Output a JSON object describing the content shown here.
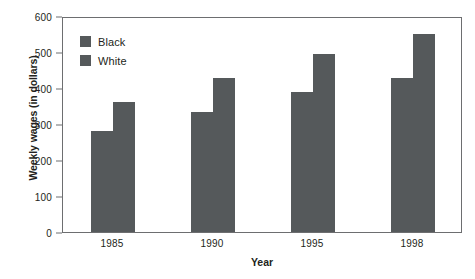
{
  "chart_data": {
    "type": "bar",
    "title": "",
    "xlabel": "Year",
    "ylabel": "Weekly wages (in dollars)",
    "categories": [
      "1985",
      "1990",
      "1995",
      "1998"
    ],
    "series": [
      {
        "name": "Black",
        "color": "#55595b",
        "values": [
          280,
          333,
          390,
          427
        ]
      },
      {
        "name": "White",
        "color": "#55595b",
        "values": [
          360,
          428,
          495,
          550
        ]
      }
    ],
    "ylim": [
      0,
      600
    ],
    "yticks": [
      0,
      100,
      200,
      300,
      400,
      500,
      600
    ],
    "ytick_labels": [
      "0",
      "100",
      "200",
      "300",
      "400",
      "500",
      "600"
    ],
    "grid": false,
    "legend_position": "top-left",
    "axis_color": "#6d6e70",
    "bar_color": "#55595b",
    "background": "#ffffff"
  },
  "legend": {
    "items": [
      {
        "label": "Black",
        "swatch_name": "legend-swatch-black"
      },
      {
        "label": "White",
        "swatch_name": "legend-swatch-white"
      }
    ]
  }
}
